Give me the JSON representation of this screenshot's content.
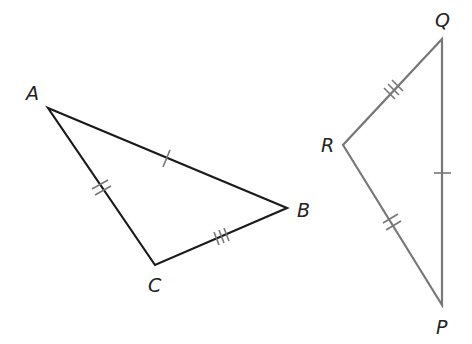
{
  "figure": {
    "triangle_abc": {
      "vertices": {
        "A": "A",
        "B": "B",
        "C": "C"
      },
      "stroke": "#1a1a1a",
      "marks": {
        "AB": 1,
        "AC": 2,
        "CB": 3
      }
    },
    "triangle_pqr": {
      "vertices": {
        "P": "P",
        "Q": "Q",
        "R": "R"
      },
      "stroke": "#777777",
      "marks": {
        "QP": 1,
        "RP": 2,
        "RQ": 3
      }
    }
  }
}
